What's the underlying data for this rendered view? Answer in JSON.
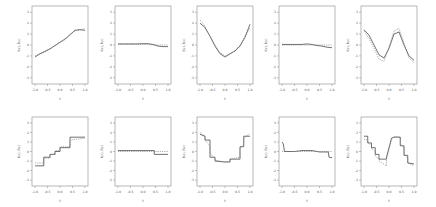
{
  "chart_data": [
    {
      "panel": 1,
      "row": 1,
      "col": 1,
      "type": "line",
      "xlabel": "t",
      "ylabel": "f(x), f̂(x)",
      "xticks": [
        "-1.0",
        "-0.5",
        "0.0",
        "0.5",
        "1.0"
      ],
      "yticks": [
        "-3",
        "-2",
        "-1",
        "0",
        "1",
        "2",
        "3"
      ],
      "xlim": [
        -1,
        1
      ],
      "ylim": [
        -3.3,
        3.3
      ],
      "x": [
        -1,
        -0.8,
        -0.6,
        -0.4,
        -0.2,
        0,
        0.2,
        0.4,
        0.6,
        0.8,
        1
      ],
      "series": [
        {
          "name": "true",
          "style": "solid",
          "values": [
            -1.1,
            -0.8,
            -0.6,
            -0.35,
            -0.05,
            0.25,
            0.55,
            0.95,
            1.35,
            1.4,
            1.35
          ]
        },
        {
          "name": "estimate",
          "style": "dashed",
          "values": [
            -1.0,
            -0.8,
            -0.55,
            -0.35,
            -0.05,
            0.25,
            0.5,
            0.9,
            1.3,
            1.4,
            1.5
          ]
        }
      ]
    },
    {
      "panel": 2,
      "row": 1,
      "col": 2,
      "type": "line",
      "xlabel": "t",
      "ylabel": "",
      "xticks": [
        "-1.0",
        "-0.5",
        "0.0",
        "0.5",
        "1.0"
      ],
      "yticks": [
        "-3",
        "-2",
        "-1",
        "0",
        "1",
        "2",
        "3"
      ],
      "xlim": [
        -1,
        1
      ],
      "ylim": [
        -3.3,
        3.3
      ],
      "x": [
        -1,
        -0.8,
        -0.6,
        -0.4,
        -0.2,
        0,
        0.2,
        0.4,
        0.6,
        0.8,
        1
      ],
      "series": [
        {
          "name": "true",
          "style": "solid",
          "values": [
            0.1,
            0.1,
            0.1,
            0.1,
            0.1,
            0.12,
            0.12,
            0.05,
            -0.1,
            -0.15,
            -0.15
          ]
        },
        {
          "name": "estimate",
          "style": "dashed",
          "values": [
            0.05,
            0.05,
            0.05,
            0.05,
            0.05,
            0.05,
            0.05,
            0.0,
            0.0,
            0.0,
            0.0
          ]
        }
      ]
    },
    {
      "panel": 3,
      "row": 1,
      "col": 3,
      "type": "line",
      "xlabel": "t",
      "ylabel": "",
      "xticks": [
        "-1.0",
        "-0.5",
        "0.0",
        "0.5",
        "1.0"
      ],
      "yticks": [
        "-3",
        "-2",
        "-1",
        "0",
        "1",
        "2",
        "3"
      ],
      "xlim": [
        -1,
        1
      ],
      "ylim": [
        -3.3,
        3.3
      ],
      "x": [
        -1,
        -0.8,
        -0.6,
        -0.4,
        -0.2,
        0,
        0.2,
        0.4,
        0.6,
        0.8,
        1
      ],
      "series": [
        {
          "name": "true",
          "style": "solid",
          "values": [
            2.0,
            1.6,
            0.8,
            -0.1,
            -0.8,
            -1.1,
            -0.8,
            -0.55,
            -0.1,
            0.7,
            1.9
          ]
        },
        {
          "name": "estimate",
          "style": "dashed",
          "values": [
            2.3,
            1.7,
            0.8,
            0.0,
            -0.7,
            -1.0,
            -0.85,
            -0.5,
            0.0,
            0.8,
            1.6
          ]
        }
      ]
    },
    {
      "panel": 4,
      "row": 1,
      "col": 4,
      "type": "line",
      "xlabel": "t",
      "ylabel": "",
      "xticks": [
        "-1.0",
        "-0.5",
        "0.0",
        "0.5",
        "1.0"
      ],
      "yticks": [
        "-3",
        "-2",
        "-1",
        "0",
        "1",
        "2",
        "3"
      ],
      "xlim": [
        -1,
        1
      ],
      "ylim": [
        -3.3,
        3.3
      ],
      "x": [
        -1,
        -0.8,
        -0.6,
        -0.4,
        -0.2,
        0,
        0.2,
        0.4,
        0.6,
        0.8,
        1
      ],
      "series": [
        {
          "name": "true",
          "style": "solid",
          "values": [
            0.05,
            0.05,
            0.05,
            0.05,
            0.05,
            0.1,
            0.05,
            -0.05,
            -0.1,
            -0.2,
            -0.25
          ]
        },
        {
          "name": "estimate",
          "style": "dashed",
          "values": [
            0.0,
            0.0,
            0.0,
            0.0,
            0.0,
            0.0,
            0.0,
            0.0,
            0.0,
            0.0,
            0.0
          ]
        }
      ]
    },
    {
      "panel": 5,
      "row": 1,
      "col": 5,
      "type": "line",
      "xlabel": "t",
      "ylabel": "",
      "xticks": [
        "-1.0",
        "-0.5",
        "0.0",
        "0.5",
        "1.0"
      ],
      "yticks": [
        "-3",
        "-2",
        "-1",
        "0",
        "1",
        "2",
        "3"
      ],
      "xlim": [
        -1,
        1
      ],
      "ylim": [
        -3.3,
        3.3
      ],
      "x": [
        -1,
        -0.8,
        -0.6,
        -0.4,
        -0.2,
        0,
        0.2,
        0.4,
        0.6,
        0.8,
        1
      ],
      "series": [
        {
          "name": "true",
          "style": "solid",
          "values": [
            1.4,
            0.9,
            0.0,
            -0.9,
            -1.2,
            -0.3,
            1.0,
            1.2,
            0.0,
            -1.0,
            -1.4
          ]
        },
        {
          "name": "estimate",
          "style": "dashed",
          "values": [
            1.3,
            0.6,
            -0.3,
            -1.3,
            -1.5,
            -0.2,
            1.3,
            1.5,
            0.2,
            -1.2,
            -1.6
          ]
        }
      ]
    },
    {
      "panel": 6,
      "row": 2,
      "col": 1,
      "type": "line",
      "xlabel": "t",
      "ylabel": "f(x), f̂(x)",
      "xticks": [
        "-1.0",
        "-0.5",
        "0.0",
        "0.5",
        "1.0"
      ],
      "yticks": [
        "-3",
        "-2",
        "-1",
        "0",
        "1",
        "2",
        "3"
      ],
      "xlim": [
        -1,
        1
      ],
      "ylim": [
        -3.3,
        3.3
      ],
      "x": [
        -1,
        -0.65,
        -0.65,
        -0.4,
        -0.4,
        -0.2,
        -0.2,
        0,
        0,
        0.4,
        0.4,
        1
      ],
      "series": [
        {
          "name": "true",
          "style": "solid",
          "values": [
            -1.5,
            -1.5,
            -0.6,
            -0.6,
            -0.3,
            -0.3,
            0.0,
            0.0,
            0.4,
            0.4,
            1.5,
            1.5
          ]
        },
        {
          "name": "estimate",
          "style": "dashed",
          "values": [
            -1.2,
            -1.2,
            -0.7,
            -0.7,
            -0.3,
            -0.3,
            0.1,
            0.1,
            0.5,
            0.5,
            1.2,
            1.4
          ]
        }
      ]
    },
    {
      "panel": 7,
      "row": 2,
      "col": 2,
      "type": "line",
      "xlabel": "t",
      "ylabel": "",
      "xticks": [
        "-1.0",
        "-0.5",
        "0.0",
        "0.5",
        "1.0"
      ],
      "yticks": [
        "-3",
        "-2",
        "-1",
        "0",
        "1",
        "2",
        "3"
      ],
      "xlim": [
        -1,
        1
      ],
      "ylim": [
        -3.3,
        3.3
      ],
      "x": [
        -1,
        -0.5,
        0,
        0.45,
        0.45,
        1
      ],
      "series": [
        {
          "name": "true",
          "style": "solid",
          "values": [
            0.1,
            0.1,
            0.1,
            0.1,
            -0.3,
            -0.3
          ]
        },
        {
          "name": "estimate",
          "style": "dashed",
          "values": [
            0.0,
            0.0,
            0.0,
            0.0,
            0.0,
            0.0
          ]
        }
      ]
    },
    {
      "panel": 8,
      "row": 2,
      "col": 3,
      "type": "line",
      "xlabel": "t",
      "ylabel": "",
      "xticks": [
        "-1.0",
        "-0.5",
        "0.0",
        "0.5",
        "1.0"
      ],
      "yticks": [
        "-3",
        "-2",
        "-1",
        "0",
        "1",
        "2",
        "3"
      ],
      "xlim": [
        -1,
        1
      ],
      "ylim": [
        -3.3,
        3.3
      ],
      "x": [
        -1,
        -0.8,
        -0.8,
        -0.6,
        -0.6,
        -0.4,
        -0.4,
        0,
        0.2,
        0.2,
        0.6,
        0.6,
        0.75,
        0.75,
        1
      ],
      "series": [
        {
          "name": "true",
          "style": "solid",
          "values": [
            1.8,
            1.6,
            1.2,
            1.2,
            -0.6,
            -0.6,
            -1.0,
            -1.1,
            -1.1,
            -0.8,
            -0.8,
            0.5,
            0.5,
            1.6,
            1.6
          ]
        },
        {
          "name": "estimate",
          "style": "dashed",
          "values": [
            2.0,
            1.6,
            1.2,
            0.6,
            -0.2,
            -0.7,
            -0.9,
            -1.1,
            -1.0,
            -0.8,
            -0.6,
            0.3,
            0.8,
            1.4,
            1.9
          ]
        }
      ]
    },
    {
      "panel": 9,
      "row": 2,
      "col": 4,
      "type": "line",
      "xlabel": "t",
      "ylabel": "",
      "xticks": [
        "-1.0",
        "-0.5",
        "0.0",
        "0.5",
        "1.0"
      ],
      "yticks": [
        "-3",
        "-2",
        "-1",
        "0",
        "1",
        "2",
        "3"
      ],
      "xlim": [
        -1,
        1
      ],
      "ylim": [
        -3.3,
        3.3
      ],
      "x": [
        -1,
        -0.95,
        -0.9,
        -0.5,
        -0.2,
        0.2,
        0.5,
        0.85,
        0.88,
        1
      ],
      "series": [
        {
          "name": "true",
          "style": "solid",
          "values": [
            1.0,
            0.8,
            0.0,
            0.0,
            0.1,
            0.1,
            -0.05,
            -0.05,
            -0.6,
            -0.65
          ]
        },
        {
          "name": "estimate",
          "style": "dashed",
          "values": [
            0.0,
            0.0,
            0.0,
            0.0,
            0.0,
            0.0,
            0.0,
            0.0,
            0.0,
            0.0
          ]
        }
      ]
    },
    {
      "panel": 10,
      "row": 2,
      "col": 5,
      "type": "line",
      "xlabel": "t",
      "ylabel": "",
      "xticks": [
        "-1.0",
        "-0.5",
        "0.0",
        "0.5",
        "1.0"
      ],
      "yticks": [
        "-3",
        "-2",
        "-1",
        "0",
        "1",
        "2",
        "3"
      ],
      "xlim": [
        -1,
        1
      ],
      "ylim": [
        -3.3,
        3.3
      ],
      "x": [
        -1,
        -0.85,
        -0.85,
        -0.7,
        -0.7,
        -0.55,
        -0.55,
        -0.4,
        -0.4,
        -0.1,
        -0.1,
        0.1,
        0.2,
        0.45,
        0.45,
        0.6,
        0.6,
        0.75,
        0.75,
        1
      ],
      "series": [
        {
          "name": "true",
          "style": "solid",
          "values": [
            1.6,
            1.6,
            0.9,
            0.9,
            0.4,
            0.4,
            -0.3,
            -0.3,
            -0.8,
            -0.8,
            -0.6,
            1.4,
            1.5,
            1.5,
            0.6,
            0.6,
            -0.4,
            -0.4,
            -1.2,
            -1.3
          ]
        },
        {
          "name": "estimate",
          "style": "dashed",
          "values": [
            1.3,
            1.2,
            0.9,
            0.6,
            0.3,
            0.0,
            -0.5,
            -0.8,
            -1.0,
            -1.5,
            -0.8,
            1.2,
            1.6,
            1.5,
            0.8,
            0.4,
            -0.3,
            -0.7,
            -1.2,
            -1.5
          ]
        }
      ]
    }
  ],
  "layout": {
    "rows": 2,
    "cols": 5,
    "line_color": "#333333",
    "dashed_color": "#777777",
    "frame_color": "#888888"
  }
}
